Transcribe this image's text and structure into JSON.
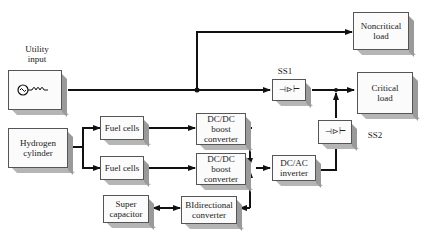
{
  "diagram": {
    "nodes": {
      "utility": {
        "label": "Utility\ninput",
        "icon": "ac-source-icon"
      },
      "noncritical": {
        "label": "Noncritical\nload"
      },
      "critical": {
        "label": "Critical\nload"
      },
      "hydrogen": {
        "label": "Hydrogen\ncylinder"
      },
      "fuel1": {
        "label": "Fuel cells"
      },
      "fuel2": {
        "label": "Fuel cells"
      },
      "boost1": {
        "label": "DC/DC\nboost\nconverter"
      },
      "boost2": {
        "label": "DC/DC\nboost\nconverter"
      },
      "supercap": {
        "label": "Super\ncapacitor"
      },
      "bidir": {
        "label": "BIdirectional\nconverter"
      },
      "inverter": {
        "label": "DC/AC\ninverter"
      },
      "ss1": {
        "label": "SS1",
        "icon": "static-switch-icon"
      },
      "ss2": {
        "label": "SS2",
        "icon": "static-switch-icon"
      }
    },
    "edges": [
      [
        "utility",
        "noncritical"
      ],
      [
        "utility",
        "ss1"
      ],
      [
        "ss1",
        "critical"
      ],
      [
        "hydrogen",
        "fuel1"
      ],
      [
        "hydrogen",
        "fuel2"
      ],
      [
        "fuel1",
        "boost1"
      ],
      [
        "fuel2",
        "boost2"
      ],
      [
        "supercap",
        "bidir",
        "bidirectional"
      ],
      [
        "boost1",
        "inverter"
      ],
      [
        "boost2",
        "inverter"
      ],
      [
        "bidir",
        "inverter",
        "bidirectional"
      ],
      [
        "inverter",
        "ss2"
      ],
      [
        "ss2",
        "critical"
      ]
    ]
  }
}
